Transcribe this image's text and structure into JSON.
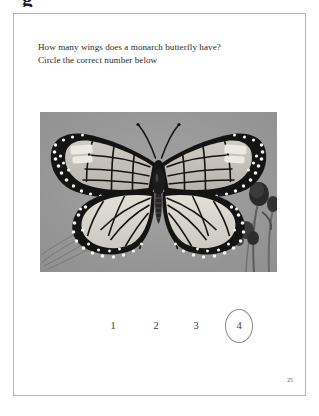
{
  "cropped_header_glyph": "g",
  "page": {
    "question": {
      "line1": "How many wings does a monarch butterfly have?",
      "line2": "Circle the correct number below"
    },
    "illustration": {
      "subject": "monarch-butterfly-photograph",
      "caption": "",
      "background_color": "#9b9b9b",
      "wing_outline_color": "#111111",
      "wing_fill_color": "#d8d5cf",
      "spot_color": "#f2f0ec",
      "body_color": "#1a1a1a"
    },
    "answers": {
      "choices": [
        "1",
        "2",
        "3",
        "4"
      ],
      "circled_choice": "4",
      "circle_color": "#8d8d8d"
    },
    "page_number": "25",
    "border_color": "#b4b4b4"
  }
}
